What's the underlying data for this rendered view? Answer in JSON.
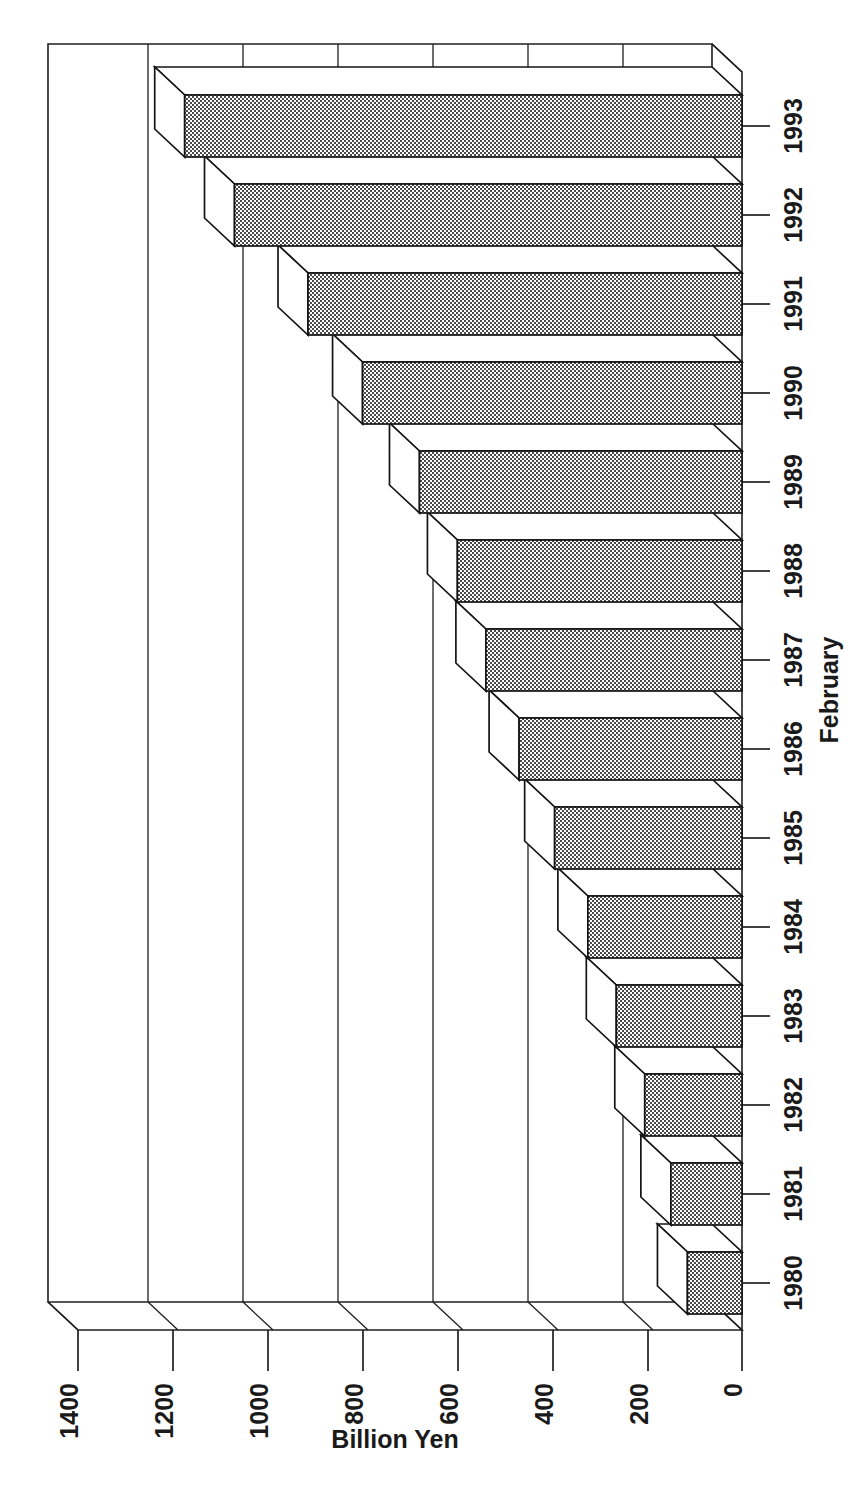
{
  "chart_data": {
    "type": "bar",
    "orientation": "horizontal",
    "style": "3d-bar",
    "title": "",
    "xlabel": "Billion Yen",
    "ylabel": "February",
    "categories": [
      "1980",
      "1981",
      "1982",
      "1983",
      "1984",
      "1985",
      "1986",
      "1987",
      "1988",
      "1989",
      "1990",
      "1991",
      "1992",
      "1993"
    ],
    "values": [
      115,
      150,
      205,
      265,
      325,
      395,
      470,
      540,
      600,
      680,
      800,
      915,
      1070,
      1175
    ],
    "value_axis_ticks": [
      0,
      200,
      400,
      600,
      800,
      1000,
      1200,
      1400
    ],
    "value_axis_tick_labels": [
      "0",
      "200",
      "400",
      "600",
      "800",
      "1000",
      "1200",
      "1400"
    ],
    "xlim": [
      0,
      1400
    ],
    "grid": true,
    "grid_axis": "value",
    "legend": "none",
    "series": [
      {
        "name": "Billion Yen",
        "values": [
          115,
          150,
          205,
          265,
          325,
          395,
          470,
          540,
          600,
          680,
          800,
          915,
          1070,
          1175
        ]
      }
    ],
    "bar_fill": "#b3b3b3",
    "bar_outline": "#141414",
    "background": "#ffffff"
  },
  "axes": {
    "value_axis_title": "Billion Yen",
    "category_axis_title": "February"
  }
}
